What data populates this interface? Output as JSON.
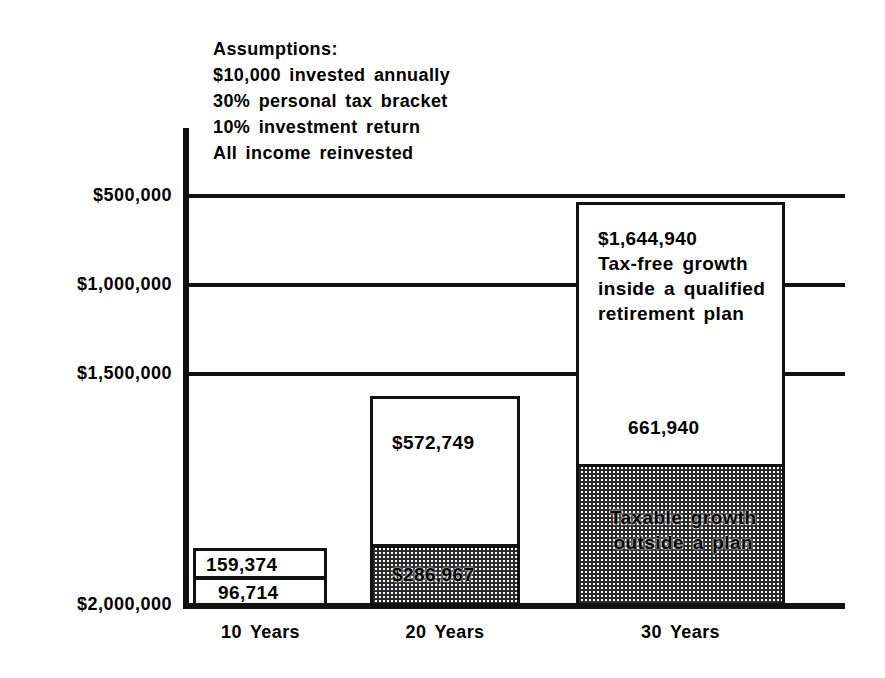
{
  "chart_data": {
    "type": "bar",
    "title": "",
    "xlabel": "",
    "ylabel": "",
    "categories": [
      "10 Years",
      "20 Years",
      "30 Years"
    ],
    "y_tick_labels": [
      "$500,000",
      "$1,000,000",
      "$1,500,000",
      "$2,000,000"
    ],
    "y_axis_note": "Axis tick labels printed in descending order from top to bottom as shown",
    "grid": true,
    "legend_position": "none",
    "series": [
      {
        "name": "Tax-free growth inside a qualified retirement plan",
        "style": "white-fill",
        "values": [
          159374,
          572749,
          1644940
        ],
        "value_labels": [
          "159,374",
          "$572,749",
          "$1,644,940"
        ]
      },
      {
        "name": "Taxable growth outside a plan",
        "style": "shaded-fill",
        "values": [
          96714,
          286967,
          661940
        ],
        "value_labels": [
          "96,714",
          "$286,967",
          "661,940"
        ]
      }
    ],
    "annotations": [
      "$1,644,940",
      "Tax-free growth inside a qualified retirement plan",
      "661,940",
      "Taxable growth outside a plan"
    ]
  },
  "assumptions": {
    "heading": "Assumptions:",
    "line1": "$10,000 invested annually",
    "line2": "30% personal tax bracket",
    "line3": "10% investment return",
    "line4": "All income reinvested"
  },
  "axis": {
    "y_ticks": {
      "t0": "$500,000",
      "t1": "$1,000,000",
      "t2": "$1,500,000",
      "t3": "$2,000,000"
    },
    "x_ticks": {
      "c0": "10 Years",
      "c1": "20 Years",
      "c2": "30 Years"
    }
  },
  "bars": {
    "bar1": {
      "top_label": "159,374",
      "bottom_label": "96,714"
    },
    "bar2": {
      "top_label": "$572,749",
      "bottom_label": "$286,967"
    },
    "bar3": {
      "top_amount": "$1,644,940",
      "top_desc_line1": "Tax-free growth",
      "top_desc_line2": "inside a qualified",
      "top_desc_line3": "retirement plan",
      "mid_label": "661,940",
      "bottom_desc_line1": "Taxable growth",
      "bottom_desc_line2": "outside a plan"
    }
  },
  "colors": {
    "ink": "#111111",
    "background": "#ffffff",
    "shade": "#2b2b2b"
  }
}
